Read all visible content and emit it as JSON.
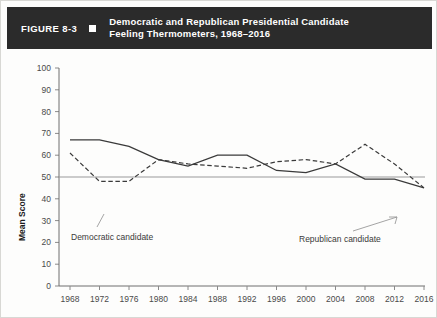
{
  "header": {
    "figure_number": "FIGURE 8-3",
    "bullet_icon": "square-bullet-icon",
    "title_line1": "Democratic and Republican Presidential Candidate",
    "title_line2": "Feeling Thermometers, 1968–2016"
  },
  "colors": {
    "banner_background": "#2b2b2b",
    "banner_text": "#ffffff",
    "line": "#3a3a3a",
    "axis": "#6f6f6f",
    "page_background": "#fdfdfc"
  },
  "annotations": {
    "democratic_label": "Democratic candidate",
    "republican_label": "Republican candidate"
  },
  "chart_data": {
    "type": "line",
    "title": "Democratic and Republican Presidential Candidate Feeling Thermometers, 1968–2016",
    "xlabel": "",
    "ylabel": "Mean Score",
    "x": [
      1968,
      1972,
      1976,
      1980,
      1984,
      1988,
      1992,
      1996,
      2000,
      2004,
      2008,
      2012,
      2016
    ],
    "xticklabels": [
      "1968",
      "1972",
      "1976",
      "1980",
      "1984",
      "1988",
      "1992",
      "1996",
      "2000",
      "2004",
      "2008",
      "2012",
      "2016"
    ],
    "yticks": [
      0,
      10,
      20,
      30,
      40,
      50,
      60,
      70,
      80,
      90,
      100
    ],
    "ylim": [
      0,
      100
    ],
    "xlim": [
      1968,
      2016
    ],
    "grid": false,
    "reference_line": 50,
    "legend": "inline-annotations",
    "series": [
      {
        "name": "Democratic candidate",
        "style": "solid",
        "values": [
          67,
          67,
          64,
          58,
          55,
          60,
          60,
          53,
          52,
          56,
          49,
          49,
          45
        ]
      },
      {
        "name": "Republican candidate",
        "style": "dashed",
        "values": [
          61,
          48,
          48,
          58,
          56,
          55,
          54,
          57,
          58,
          56,
          65,
          56,
          45
        ]
      }
    ]
  }
}
